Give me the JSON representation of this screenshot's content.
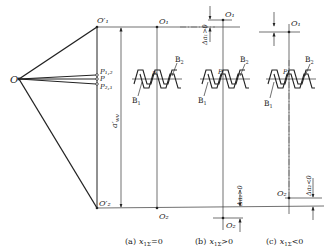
{
  "diagram": {
    "type": "gear-mesh center distance variation diagram",
    "points": {
      "O": "O",
      "O1_prime": "O′₁",
      "O2_prime": "O′₂",
      "O1": "O₁",
      "O2": "O₂",
      "P12": "P₁,₂",
      "P": "P",
      "P21": "P₂,₁"
    },
    "dimension": {
      "center_distance": "a′",
      "center_distance_sub": "wv"
    },
    "gears": {
      "B1": "B",
      "B1_sub": "1",
      "B2": "B",
      "B2_sub": "2",
      "pitch_point": "P"
    },
    "panels": [
      {
        "id": "a",
        "caption_prefix": "(a)",
        "caption_var": "x",
        "caption_sub": "1Σ",
        "caption_rel": "=0"
      },
      {
        "id": "b",
        "caption_prefix": "(b)",
        "caption_var": "x",
        "caption_sub": "1Σ",
        "caption_rel": ">0",
        "delta_top": "Δa₁>0",
        "delta_bottom": "Δa₂>0"
      },
      {
        "id": "c",
        "caption_prefix": "(c)",
        "caption_var": "x",
        "caption_sub": "1Σ",
        "caption_rel": "<0",
        "delta_top": "Δa₁<0",
        "delta_bottom": "Δa₂<0"
      }
    ]
  }
}
